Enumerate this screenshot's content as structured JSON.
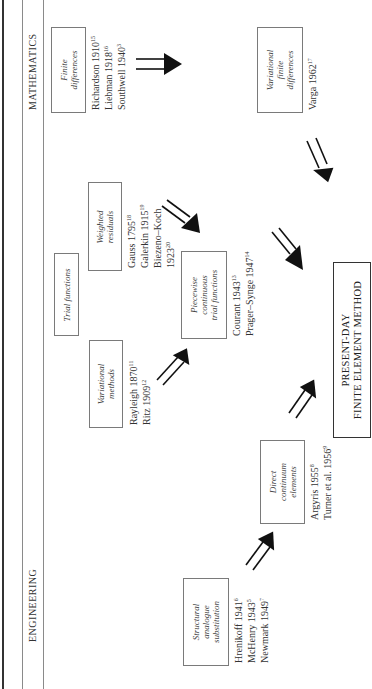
{
  "header": {
    "left_label": "MATHEMATICS",
    "right_label": "ENGINEERING"
  },
  "nodes": {
    "finite_differences": {
      "label_lines": [
        "Finite",
        "differences"
      ],
      "refs": [
        {
          "text": "Richardson 1910",
          "sup": "15"
        },
        {
          "text": "Liebman 1918",
          "sup": "16"
        },
        {
          "text": "Southwell 1940",
          "sup": "3"
        }
      ]
    },
    "variational_finite_differences": {
      "label_lines": [
        "Variational",
        "finite",
        "differences"
      ],
      "refs": [
        {
          "text": "Varga 1962",
          "sup": "17"
        }
      ]
    },
    "trial_functions": {
      "label_lines": [
        "Trial functions"
      ]
    },
    "weighted_residuals": {
      "label_lines": [
        "Weighted",
        "residuals"
      ],
      "refs": [
        {
          "text": "Gauss 1795",
          "sup": "18"
        },
        {
          "text": "Galerkin 1915",
          "sup": "19"
        },
        {
          "text": "Biezeno–Koch",
          "sup": ""
        },
        {
          "text": "1923",
          "sup": "20"
        }
      ]
    },
    "variational_methods": {
      "label_lines": [
        "Variational",
        "methods"
      ],
      "refs": [
        {
          "text": "Rayleigh 1870",
          "sup": "11"
        },
        {
          "text": "Ritz 1909",
          "sup": "12"
        }
      ]
    },
    "piecewise_continuous": {
      "label_lines": [
        "Piecewise",
        "continuous",
        "trial functions"
      ],
      "refs": [
        {
          "text": "Courant 1943",
          "sup": "13"
        },
        {
          "text": "Prager–Synge 1947",
          "sup": "14"
        }
      ]
    },
    "present_day_fem": {
      "label_lines": [
        "PRESENT-DAY",
        "FINITE ELEMENT METHOD"
      ]
    },
    "direct_continuum": {
      "label_lines": [
        "Direct",
        "continuum",
        "elements"
      ],
      "refs": [
        {
          "text": "Argyris 1955",
          "sup": "8"
        },
        {
          "text": "Turner et al. 1956",
          "sup": "9"
        }
      ]
    },
    "structural_analogue": {
      "label_lines": [
        "Structural",
        "analogue",
        "substitution"
      ],
      "refs": [
        {
          "text": "Hrenikoff 1941",
          "sup": "6"
        },
        {
          "text": "McHenry 1943",
          "sup": "5"
        },
        {
          "text": "Newmark 1949",
          "sup": "7"
        }
      ]
    }
  },
  "edges": [
    {
      "from": "finite_differences",
      "to": "variational_finite_differences"
    },
    {
      "from": "variational_finite_differences",
      "to": "present_day_fem"
    },
    {
      "from": "weighted_residuals",
      "to": "piecewise_continuous"
    },
    {
      "from": "piecewise_continuous",
      "to": "present_day_fem"
    },
    {
      "from": "variational_methods",
      "to": "piecewise_continuous"
    },
    {
      "from": "direct_continuum",
      "to": "present_day_fem"
    },
    {
      "from": "structural_analogue",
      "to": "direct_continuum"
    }
  ]
}
